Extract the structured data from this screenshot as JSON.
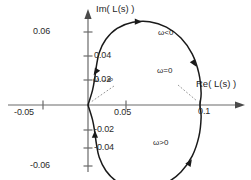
{
  "chart_data": {
    "type": "line",
    "title": "",
    "subtitle": "",
    "xlabel": "Re( L(s) )",
    "ylabel": "Im( L(s) )",
    "xlim": [
      -0.065,
      0.118
    ],
    "ylim": [
      -0.075,
      0.075
    ],
    "grid": false,
    "legend": null,
    "x_ticks": [
      {
        "value": -0.05,
        "label": "-0.05"
      },
      {
        "value": 0.05,
        "label": "0.05"
      },
      {
        "value": 0.1,
        "label": "0.1"
      }
    ],
    "y_ticks": [
      {
        "value": 0.06,
        "label": "0.06"
      },
      {
        "value": 0.04,
        "label": "0.04"
      },
      {
        "value": 0.02,
        "label": "0.02"
      },
      {
        "value": -0.02,
        "label": "-0.02"
      },
      {
        "value": -0.04,
        "label": "-0.04"
      },
      {
        "value": -0.06,
        "label": "-0.06"
      }
    ],
    "series": [
      {
        "name": "Nyquist contour of L(s)",
        "closed": true,
        "points": [
          [
            0.0,
            0.0
          ],
          [
            0.004,
            0.012
          ],
          [
            0.006,
            0.022
          ],
          [
            0.0075,
            0.032
          ],
          [
            0.01,
            0.043
          ],
          [
            0.016,
            0.054
          ],
          [
            0.026,
            0.063
          ],
          [
            0.04,
            0.068
          ],
          [
            0.055,
            0.0685
          ],
          [
            0.07,
            0.064
          ],
          [
            0.083,
            0.055
          ],
          [
            0.093,
            0.042
          ],
          [
            0.099,
            0.026
          ],
          [
            0.101,
            0.01
          ],
          [
            0.1,
            0.0
          ],
          [
            0.101,
            -0.01
          ],
          [
            0.099,
            -0.026
          ],
          [
            0.093,
            -0.042
          ],
          [
            0.083,
            -0.055
          ],
          [
            0.07,
            -0.064
          ],
          [
            0.055,
            -0.0685
          ],
          [
            0.04,
            -0.068
          ],
          [
            0.026,
            -0.063
          ],
          [
            0.016,
            -0.054
          ],
          [
            0.01,
            -0.043
          ],
          [
            0.0075,
            -0.032
          ],
          [
            0.006,
            -0.022
          ],
          [
            0.004,
            -0.012
          ],
          [
            0.0,
            0.0
          ]
        ]
      }
    ],
    "annotations": [
      {
        "id": "omega-neg",
        "text": "ω<0",
        "x": 0.074,
        "y": 0.0585,
        "leader": false
      },
      {
        "id": "omega-zero",
        "text": "ω=0",
        "x": 0.055,
        "y": 0.015,
        "leader": true,
        "target": [
          0.1,
          0.0
        ]
      },
      {
        "id": "omega-inf",
        "text": "ω→∞",
        "x": 0.013,
        "y": 0.012,
        "leader": true,
        "target": [
          0.0,
          0.0
        ]
      },
      {
        "id": "omega-pos",
        "text": "ω>0",
        "x": 0.068,
        "y": -0.0565,
        "leader": false
      }
    ],
    "arrows": [
      {
        "at": [
          0.045,
          0.0685
        ],
        "direction": "right",
        "note": "traverse-top-rightward"
      },
      {
        "at": [
          0.095,
          0.034
        ],
        "direction": "down-right",
        "note": "traverse-upper-right-downward"
      },
      {
        "at": [
          0.0068,
          0.027
        ],
        "direction": "down-left",
        "note": "traverse-upper-left-toward-origin"
      },
      {
        "at": [
          0.0062,
          -0.024
        ],
        "direction": "up",
        "note": "traverse-lower-left-upward"
      },
      {
        "at": [
          0.091,
          -0.047
        ],
        "direction": "up-right",
        "note": "traverse-lower-right-upward"
      },
      {
        "at": [
          0.045,
          -0.0685
        ],
        "direction": "left",
        "note": "traverse-bottom-leftward"
      }
    ],
    "colors": {
      "curve": "#1a1a1a",
      "axis": "#6a6a6a",
      "text": "#1f1f1f",
      "leader": "#8a8a8a",
      "background": "#ffffff"
    }
  }
}
